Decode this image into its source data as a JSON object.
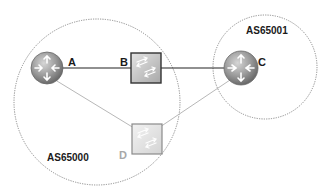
{
  "diagram": {
    "type": "network-topology",
    "autonomous_systems": [
      {
        "id": "as65000",
        "label": "AS65000",
        "shape": "dotted-circle",
        "cx": 97,
        "cy": 102,
        "r": 83
      },
      {
        "id": "as65001",
        "label": "AS65001",
        "shape": "dotted-circle",
        "cx": 265,
        "cy": 67,
        "r": 52
      }
    ],
    "nodes": [
      {
        "id": "A",
        "label": "A",
        "kind": "router",
        "icon": "router-icon",
        "cx": 47,
        "cy": 68,
        "r": 16,
        "as": "AS65000",
        "dimmed": false
      },
      {
        "id": "B",
        "label": "B",
        "kind": "switch",
        "icon": "switch-icon",
        "x": 131,
        "y": 53,
        "w": 30,
        "h": 30,
        "as": "AS65000",
        "dimmed": false
      },
      {
        "id": "C",
        "label": "C",
        "kind": "router",
        "icon": "router-icon",
        "cx": 241,
        "cy": 68,
        "r": 17,
        "as": "AS65001",
        "dimmed": false
      },
      {
        "id": "D",
        "label": "D",
        "kind": "switch",
        "icon": "switch-icon",
        "x": 132,
        "y": 124,
        "w": 30,
        "h": 30,
        "as": "AS65000",
        "dimmed": true
      }
    ],
    "links": [
      {
        "from": "A",
        "to": "B",
        "style": "solid-dark"
      },
      {
        "from": "B",
        "to": "C",
        "style": "solid-dark"
      },
      {
        "from": "A",
        "to": "D",
        "style": "solid-light"
      },
      {
        "from": "D",
        "to": "C",
        "style": "solid-light"
      }
    ],
    "colors": {
      "link_dark": "#222222",
      "link_light": "#b8b8b8",
      "boundary": "#8a8a8a",
      "router_fill": "#9a9a9a",
      "switch_fill": "#c8c8c8",
      "switch_fill_dim": "#e2e2e2",
      "label_dark": "#1a1a1a",
      "label_dim": "#a8a8a8"
    }
  }
}
